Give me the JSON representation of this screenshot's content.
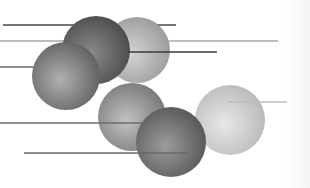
{
  "illustration": {
    "description": "decorative spheres with horizontal lines",
    "background": "#ffffff",
    "spheres": [
      {
        "id": "sphere-back-light",
        "cx": 137,
        "cy": 50,
        "r": 33,
        "light": "#d4d4d4",
        "dark": "#9a9a9a"
      },
      {
        "id": "sphere-top-dark",
        "cx": 96,
        "cy": 50,
        "r": 34,
        "light": "#8a8a8a",
        "dark": "#4a4a4a"
      },
      {
        "id": "sphere-left",
        "cx": 66,
        "cy": 76,
        "r": 34,
        "light": "#b0b0b0",
        "dark": "#5e5e5e"
      },
      {
        "id": "sphere-middle",
        "cx": 132,
        "cy": 117,
        "r": 34,
        "light": "#c2c2c2",
        "dark": "#767676"
      },
      {
        "id": "sphere-right-light",
        "cx": 230,
        "cy": 120,
        "r": 35,
        "light": "#e8e8e8",
        "dark": "#b8b8b8"
      },
      {
        "id": "sphere-bottom-dark",
        "cx": 171,
        "cy": 142,
        "r": 35,
        "light": "#9c9c9c",
        "dark": "#555555"
      }
    ],
    "lines_back": [
      {
        "id": "line-top-dark",
        "x1": 3,
        "x2": 176,
        "y": 25,
        "color": "#4a4a4a",
        "width": 1.6
      },
      {
        "id": "line-long-light",
        "x1": 0,
        "x2": 278,
        "y": 41,
        "color": "#a9a9a9",
        "width": 1.4
      }
    ],
    "lines_front": [
      {
        "id": "line-mid-dark",
        "x1": 128,
        "x2": 217,
        "y": 52,
        "color": "#3c3c3c",
        "width": 1.6
      },
      {
        "id": "line-left-short",
        "x1": 0,
        "x2": 34,
        "y": 67,
        "color": "#6a6a6a",
        "width": 1.4
      },
      {
        "id": "line-lower",
        "x1": 0,
        "x2": 146,
        "y": 123,
        "color": "#6c6c6c",
        "width": 1.4
      },
      {
        "id": "line-bottom",
        "x1": 24,
        "x2": 187,
        "y": 153,
        "color": "#6a6a6a",
        "width": 1.4
      },
      {
        "id": "line-right-light",
        "x1": 228,
        "x2": 287,
        "y": 102,
        "color": "#bdbdbd",
        "width": 1.4
      }
    ]
  }
}
